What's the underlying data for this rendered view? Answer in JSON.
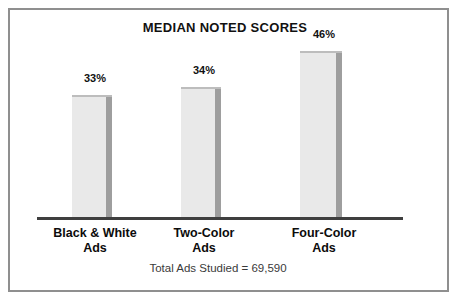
{
  "chart_data": {
    "type": "bar",
    "title": "MEDIAN NOTED SCORES",
    "categories": [
      "Black & White Ads",
      "Two-Color Ads",
      "Four-Color Ads"
    ],
    "values": [
      33,
      34,
      46
    ],
    "unit": "%",
    "bars": [
      {
        "label_line1": "Black & White",
        "label_line2": "Ads",
        "value": 33,
        "value_label": "33%"
      },
      {
        "label_line1": "Two-Color",
        "label_line2": "Ads",
        "value": 34,
        "value_label": "34%"
      },
      {
        "label_line1": "Four-Color",
        "label_line2": "Ads",
        "value": 46,
        "value_label": "46%"
      }
    ],
    "footnote": "Total Ads Studied = 69,590",
    "xlabel": "",
    "ylabel": "",
    "ylim": [
      0,
      50
    ],
    "grid": false,
    "legend": "none",
    "colors": {
      "bar_fill": "#e9e9e9",
      "bar_top_edge": "#bdbdbd",
      "bar_side_shadow": "#9e9e9e",
      "axis_line": "#3f3f3f",
      "frame_border": "#8f8f8f",
      "text": "#111111"
    }
  }
}
